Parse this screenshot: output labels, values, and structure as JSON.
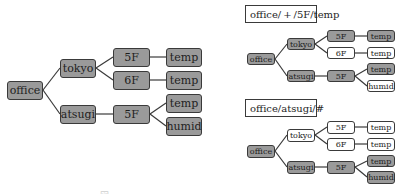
{
  "colors": {
    "filled": "#9a9a9a",
    "empty": "#ffffff",
    "border": "#3a3a3a",
    "edge": "#3a3a3a"
  },
  "main_tree": {
    "nodes": {
      "office": "office",
      "tokyo": "tokyo",
      "atsugi": "atsugi",
      "tokyo_5f": "5F",
      "tokyo_6f": "6F",
      "atsugi_5f": "5F",
      "tokyo_5f_temp": "temp",
      "tokyo_6f_temp": "temp",
      "atsugi_5f_temp": "temp",
      "atsugi_5f_humid": "humid"
    }
  },
  "example_1": {
    "topic": "office/ + /5F/temp",
    "nodes": {
      "office": "office",
      "tokyo": "tokyo",
      "atsugi": "atsugi",
      "tokyo_5f": "5F",
      "tokyo_6f": "6F",
      "atsugi_5f": "5F",
      "tokyo_5f_temp": "temp",
      "tokyo_6f_temp": "temp",
      "atsugi_5f_temp": "temp",
      "atsugi_5f_humid": "humid"
    },
    "highlighted": [
      "office",
      "tokyo",
      "atsugi",
      "tokyo_5f",
      "atsugi_5f",
      "tokyo_5f_temp",
      "atsugi_5f_temp"
    ]
  },
  "example_2": {
    "topic": "office/atsugi/#",
    "nodes": {
      "office": "office",
      "tokyo": "tokyo",
      "atsugi": "atsugi",
      "tokyo_5f": "5F",
      "tokyo_6f": "6F",
      "atsugi_5f": "5F",
      "tokyo_5f_temp": "temp",
      "tokyo_6f_temp": "temp",
      "atsugi_5f_temp": "temp",
      "atsugi_5f_humid": "humid"
    },
    "highlighted": [
      "office",
      "atsugi",
      "atsugi_5f",
      "atsugi_5f_temp",
      "atsugi_5f_humid"
    ]
  },
  "caption": "図 ..."
}
